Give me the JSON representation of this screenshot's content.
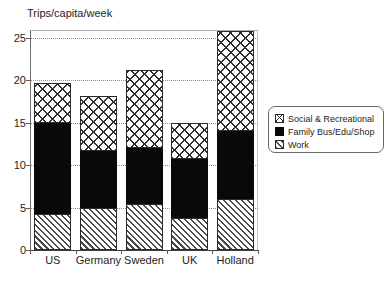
{
  "chart_data": {
    "type": "bar",
    "subtype": "stacked-bar",
    "title": "Trips/capita/week",
    "xlabel": "",
    "ylabel": "",
    "ylim": [
      0,
      25
    ],
    "yticks": [
      0,
      5,
      10,
      15,
      20,
      25
    ],
    "grid": "horizontal-dotted",
    "legend_position": "right",
    "categories": [
      "US",
      "Germany",
      "Sweden",
      "UK",
      "Holland"
    ],
    "series": [
      {
        "name": "Work",
        "pattern": "diagonal-hatch",
        "color": "#ffffff",
        "values": [
          4.3,
          5.0,
          5.4,
          3.8,
          6.0
        ]
      },
      {
        "name": "Family Bus/Edu/Shop",
        "pattern": "solid-black",
        "color": "#090909",
        "values": [
          10.7,
          6.7,
          6.6,
          6.9,
          8.0
        ]
      },
      {
        "name": "Social & Recreational",
        "pattern": "crosshatch",
        "color": "#ffffff",
        "values": [
          4.7,
          6.5,
          9.2,
          4.3,
          11.8
        ]
      }
    ],
    "totals": [
      19.7,
      18.2,
      21.2,
      15.0,
      25.8
    ]
  },
  "legend": {
    "entries": [
      {
        "label": "Social & Recreational",
        "pattern": "crosshatch"
      },
      {
        "label": "Family Bus/Edu/Shop",
        "pattern": "solid-black"
      },
      {
        "label": "Work",
        "pattern": "diagonal-hatch"
      }
    ]
  }
}
